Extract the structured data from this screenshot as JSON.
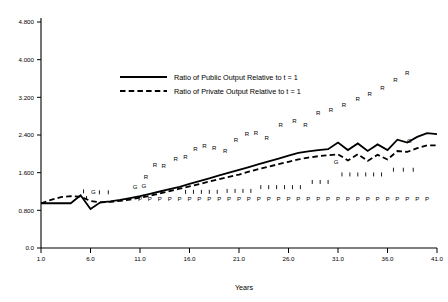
{
  "chart_data": {
    "type": "line",
    "title": "",
    "xlabel": "Years",
    "ylabel": "",
    "xlim": [
      1.0,
      41.0
    ],
    "ylim": [
      0.0,
      4.8
    ],
    "grid": false,
    "legend_position": "upper-center-left",
    "x_ticks": [
      "1.0",
      "6.0",
      "11.0",
      "16.0",
      "21.0",
      "26.0",
      "31.0",
      "36.0",
      "41.0"
    ],
    "x_tick_values": [
      1.0,
      6.0,
      11.0,
      16.0,
      21.0,
      26.0,
      31.0,
      36.0,
      41.0
    ],
    "y_ticks": [
      "0.0",
      "0.800",
      "1.600",
      "2.400",
      "3.200",
      "4.000",
      "4.800"
    ],
    "y_tick_values": [
      0.0,
      0.8,
      1.6,
      2.4,
      3.2,
      4.0,
      4.8
    ],
    "series": [
      {
        "name": "Ratio of Public Output Relative to t = 1",
        "style": "solid",
        "x": [
          1,
          2,
          3,
          4,
          5,
          6,
          7,
          8,
          9,
          10,
          11,
          12,
          13,
          14,
          15,
          16,
          17,
          18,
          19,
          20,
          21,
          22,
          23,
          24,
          25,
          26,
          27,
          28,
          29,
          30,
          31,
          32,
          33,
          34,
          35,
          36,
          37,
          38,
          39,
          40,
          41
        ],
        "values": [
          0.95,
          0.95,
          0.95,
          0.95,
          1.12,
          0.83,
          0.97,
          0.99,
          1.02,
          1.06,
          1.1,
          1.15,
          1.2,
          1.25,
          1.3,
          1.36,
          1.42,
          1.48,
          1.54,
          1.6,
          1.66,
          1.72,
          1.78,
          1.84,
          1.9,
          1.96,
          2.02,
          2.05,
          2.08,
          2.1,
          2.24,
          2.08,
          2.22,
          2.06,
          2.2,
          2.08,
          2.3,
          2.24,
          2.36,
          2.44,
          2.42
        ]
      },
      {
        "name": "Ratio of Private Output Relative to t = 1",
        "style": "dashed",
        "x": [
          1,
          2,
          3,
          4,
          5,
          6,
          7,
          8,
          9,
          10,
          11,
          12,
          13,
          14,
          15,
          16,
          17,
          18,
          19,
          20,
          21,
          22,
          23,
          24,
          25,
          26,
          27,
          28,
          29,
          30,
          31,
          32,
          33,
          34,
          35,
          36,
          37,
          38,
          39,
          40,
          41
        ],
        "values": [
          0.95,
          1.02,
          1.08,
          1.1,
          1.09,
          1.0,
          0.97,
          0.98,
          1.0,
          1.03,
          1.07,
          1.11,
          1.16,
          1.21,
          1.26,
          1.31,
          1.36,
          1.41,
          1.46,
          1.51,
          1.56,
          1.62,
          1.68,
          1.73,
          1.78,
          1.83,
          1.88,
          1.92,
          1.95,
          1.97,
          1.99,
          1.86,
          1.99,
          1.85,
          1.98,
          1.88,
          2.06,
          2.04,
          2.12,
          2.18,
          2.18
        ]
      }
    ],
    "annotations": {
      "R_markers": {
        "label": "R",
        "description": "Scattered R letters ascending from lower-left to upper-right",
        "points": [
          [
            11.6,
            1.46
          ],
          [
            12.5,
            1.71
          ],
          [
            13.4,
            1.7
          ],
          [
            14.6,
            1.85
          ],
          [
            15.6,
            1.9
          ],
          [
            16.6,
            2.06
          ],
          [
            17.5,
            2.12
          ],
          [
            18.5,
            2.08
          ],
          [
            19.6,
            2.02
          ],
          [
            20.7,
            2.26
          ],
          [
            21.8,
            2.38
          ],
          [
            22.7,
            2.4
          ],
          [
            23.8,
            2.3
          ],
          [
            25.2,
            2.58
          ],
          [
            26.6,
            2.66
          ],
          [
            27.7,
            2.58
          ],
          [
            29.0,
            2.82
          ],
          [
            30.3,
            2.88
          ],
          [
            31.6,
            3.0
          ],
          [
            33.0,
            3.12
          ],
          [
            34.2,
            3.22
          ],
          [
            35.5,
            3.36
          ],
          [
            36.8,
            3.52
          ],
          [
            38.0,
            3.68
          ]
        ]
      },
      "P_markers": {
        "label": "P",
        "description": "Row of P letters along a near-horizontal line just under the curves",
        "y": 1.0,
        "x_start": 11.0,
        "x_end": 40.0,
        "count": 30
      },
      "G_markers": {
        "label": "G",
        "description": "G letters near the curves",
        "points": [
          [
            6.3,
            1.14
          ],
          [
            10.5,
            1.26
          ],
          [
            11.4,
            1.27
          ],
          [
            30.8,
            1.78
          ],
          [
            38.2,
            2.24
          ]
        ]
      },
      "I_markers": {
        "label": "I",
        "description": "Short vertical tick marks below the private-output curve",
        "points": [
          [
            5.3,
            1.16
          ],
          [
            5.6,
            1.02
          ],
          [
            6.9,
            1.14
          ],
          [
            7.8,
            1.14
          ],
          [
            15.6,
            1.15
          ],
          [
            16.4,
            1.15
          ],
          [
            17.2,
            1.15
          ],
          [
            18.0,
            1.15
          ],
          [
            18.8,
            1.15
          ],
          [
            19.8,
            1.17
          ],
          [
            20.6,
            1.17
          ],
          [
            21.4,
            1.17
          ],
          [
            22.2,
            1.17
          ],
          [
            23.2,
            1.25
          ],
          [
            24.0,
            1.25
          ],
          [
            24.8,
            1.25
          ],
          [
            25.6,
            1.25
          ],
          [
            26.4,
            1.25
          ],
          [
            27.2,
            1.25
          ],
          [
            28.4,
            1.36
          ],
          [
            29.2,
            1.36
          ],
          [
            30.0,
            1.36
          ],
          [
            31.4,
            1.52
          ],
          [
            32.2,
            1.52
          ],
          [
            33.0,
            1.52
          ],
          [
            33.8,
            1.52
          ],
          [
            34.6,
            1.52
          ],
          [
            35.4,
            1.52
          ],
          [
            36.6,
            1.62
          ],
          [
            37.6,
            1.62
          ],
          [
            38.6,
            1.62
          ]
        ]
      }
    }
  },
  "legend": {
    "entries": [
      {
        "label": "Ratio of Public Output Relative to t = 1",
        "style": "solid"
      },
      {
        "label": "Ratio of Private Output Relative to t = 1",
        "style": "dashed"
      }
    ]
  },
  "colors": {
    "background": "#ffffff",
    "ink": "#000000"
  }
}
